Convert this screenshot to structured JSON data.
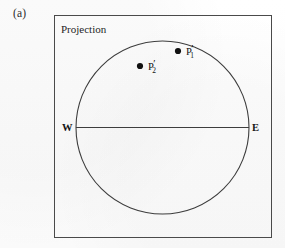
{
  "figure": {
    "panel_label": "(a)",
    "caption": "Projection",
    "background_color": "#fdfdfd",
    "stroke_color": "#4a4a4a"
  },
  "frame": {
    "name": "outer-frame",
    "x": 54,
    "y": 15,
    "width": 218,
    "height": 223
  },
  "chart_data": {
    "type": "scatter",
    "title": "Projection",
    "panel": "(a)",
    "xlabel": "",
    "ylabel": "",
    "projection_circle": {
      "center_x": 162.5,
      "center_y": 127.5,
      "radius": 86.5,
      "stroke": "#3d3d3d",
      "fill": "none"
    },
    "equator_line": {
      "label_left": "W",
      "label_right": "E",
      "x1": 76,
      "y1": 127.5,
      "x2": 249,
      "y2": 127.5,
      "stroke": "#3d3d3d"
    },
    "points": [
      {
        "id": "P1",
        "base": "P",
        "prime": "′",
        "subscript": "1",
        "label": "P′1",
        "cx": 178,
        "cy": 51,
        "r": 3.1,
        "fill": "#111111"
      },
      {
        "id": "P2",
        "base": "P",
        "prime": "′",
        "subscript": "2",
        "label": "P′2",
        "cx": 140,
        "cy": 66,
        "r": 3.1,
        "fill": "#111111"
      }
    ],
    "grid": false,
    "legend": "none",
    "annotations": [
      "(a)",
      "Projection",
      "W",
      "E",
      "P′1",
      "P′2"
    ]
  },
  "compass": {
    "west": "W",
    "east": "E"
  },
  "points_labels": {
    "p1": {
      "base": "P",
      "prime": "′",
      "sub": "1"
    },
    "p2": {
      "base": "P",
      "prime": "′",
      "sub": "2"
    }
  }
}
